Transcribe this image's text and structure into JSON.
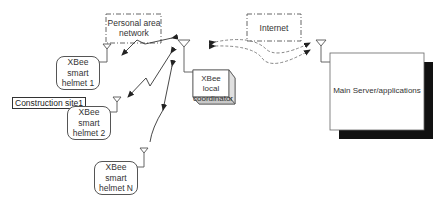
{
  "diagram": {
    "nodes": {
      "pan": {
        "label_line1": "Personal area",
        "label_line2": "network"
      },
      "internet": {
        "label": "Internet"
      },
      "helmet1": {
        "line1": "XBee",
        "line2": "smart",
        "line3": "helmet 1"
      },
      "helmet2": {
        "line1": "XBee",
        "line2": "smart",
        "line3": "helmet 2"
      },
      "helmetN": {
        "line1": "XBee",
        "line2": "smart",
        "line3": "helmet N"
      },
      "site": {
        "label": "Construction site1"
      },
      "coordinator": {
        "line1": "XBee local",
        "line2": "coordinator"
      },
      "server": {
        "label": "Main Server/applications"
      }
    },
    "edges": [
      {
        "from": "helmet1",
        "to": "coordinator",
        "style": "lightning-bidirectional"
      },
      {
        "from": "helmet2",
        "to": "coordinator",
        "style": "lightning-bidirectional"
      },
      {
        "from": "helmetN",
        "to": "coordinator",
        "style": "curved-bidirectional"
      },
      {
        "from": "coordinator",
        "to": "server",
        "style": "dashed-curved-bidirectional",
        "via": "internet"
      }
    ],
    "colors": {
      "line": "#333333",
      "dashed": "#777777",
      "shadow": "#111111",
      "box_side": "#cfcfcf"
    }
  }
}
